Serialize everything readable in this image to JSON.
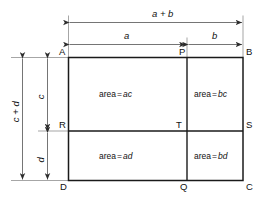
{
  "figure": {
    "colors": {
      "rect_stroke": "#1a1a1a",
      "dim_stroke": "#4a4a4a",
      "background": "#ffffff",
      "text": "#111111"
    },
    "vertices": {
      "a": "A",
      "b": "B",
      "c": "C",
      "d": "D",
      "p": "P",
      "q": "Q",
      "r": "R",
      "s": "S",
      "t": "T"
    },
    "dimensions": {
      "total_width": "a + b",
      "left_width": "a",
      "right_width": "b",
      "total_height": "c + d",
      "upper_height": "c",
      "lower_height": "d"
    },
    "areas": {
      "top_left": {
        "label": "area",
        "eq": "=",
        "value": "ac"
      },
      "top_right": {
        "label": "area",
        "eq": "=",
        "value": "bc"
      },
      "bottom_left": {
        "label": "area",
        "eq": "=",
        "value": "ad"
      },
      "bottom_right": {
        "label": "area",
        "eq": "=",
        "value": "bd"
      }
    }
  }
}
